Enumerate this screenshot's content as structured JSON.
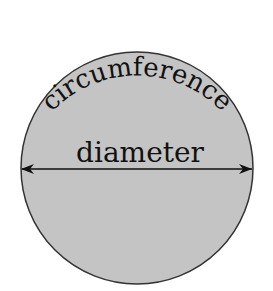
{
  "diagram": {
    "type": "circle-anatomy",
    "labels": {
      "circumference": "circumference",
      "diameter": "diameter"
    },
    "colors": {
      "circle_fill": "#c4c4c4",
      "circle_stroke": "#333333",
      "text": "#111111",
      "background": "#ffffff"
    }
  }
}
